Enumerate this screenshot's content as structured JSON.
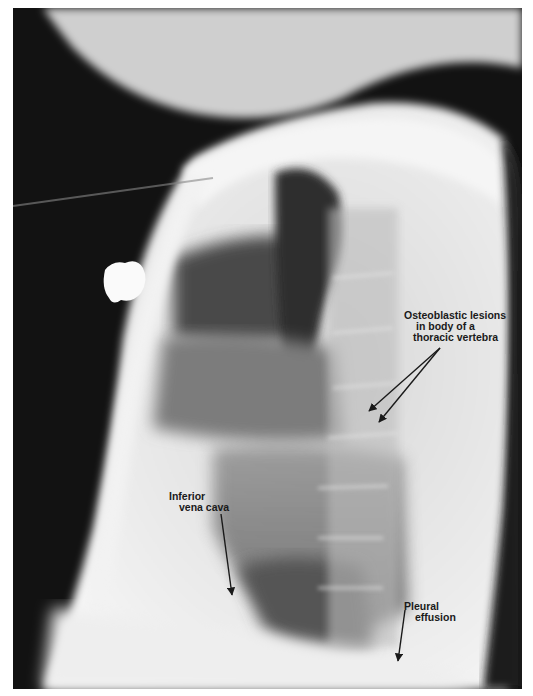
{
  "figure": {
    "colors": {
      "background": "#ffffff",
      "film_dark": "#111111",
      "soft_tissue": "#e8e8e8",
      "lung": "#5a5a5a",
      "label_text": "#1a1a1a"
    }
  },
  "annotations": [
    {
      "id": "osteoblastic",
      "lines": [
        "Osteoblastic lesions",
        "in body of a",
        "thoracic vertebra"
      ]
    },
    {
      "id": "ivc",
      "lines": [
        "Inferior",
        "vena cava"
      ]
    },
    {
      "id": "pleural",
      "lines": [
        "Pleural",
        "effusion"
      ]
    }
  ]
}
